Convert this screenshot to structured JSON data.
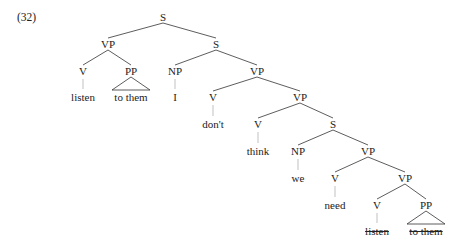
{
  "example_number": "(32)",
  "tree": {
    "nodes": [
      {
        "id": "s0",
        "label": "S",
        "x": 163,
        "y": 17
      },
      {
        "id": "vp1",
        "label": "VP",
        "x": 108,
        "y": 44
      },
      {
        "id": "s1",
        "label": "S",
        "x": 216,
        "y": 44
      },
      {
        "id": "v1",
        "label": "V",
        "x": 83,
        "y": 71
      },
      {
        "id": "pp1",
        "label": "PP",
        "x": 131,
        "y": 71
      },
      {
        "id": "np1",
        "label": "NP",
        "x": 175,
        "y": 71
      },
      {
        "id": "vp2",
        "label": "VP",
        "x": 257,
        "y": 71
      },
      {
        "id": "w_listen1",
        "label": "listen",
        "x": 83,
        "y": 97,
        "leaf": true
      },
      {
        "id": "w_tothem1",
        "label": "to them",
        "x": 131,
        "y": 97,
        "leaf": true
      },
      {
        "id": "w_I",
        "label": "I",
        "x": 175,
        "y": 97,
        "leaf": true
      },
      {
        "id": "v2",
        "label": "V",
        "x": 213,
        "y": 97
      },
      {
        "id": "vp3",
        "label": "VP",
        "x": 300,
        "y": 97
      },
      {
        "id": "w_dont",
        "label": "don't",
        "x": 213,
        "y": 124,
        "leaf": true
      },
      {
        "id": "v3",
        "label": "V",
        "x": 258,
        "y": 124
      },
      {
        "id": "s2",
        "label": "S",
        "x": 333,
        "y": 124
      },
      {
        "id": "w_think",
        "label": "think",
        "x": 258,
        "y": 151,
        "leaf": true
      },
      {
        "id": "np2",
        "label": "NP",
        "x": 298,
        "y": 151
      },
      {
        "id": "vp4",
        "label": "VP",
        "x": 368,
        "y": 151
      },
      {
        "id": "w_we",
        "label": "we",
        "x": 298,
        "y": 178,
        "leaf": true
      },
      {
        "id": "v4",
        "label": "V",
        "x": 335,
        "y": 178
      },
      {
        "id": "vp5",
        "label": "VP",
        "x": 405,
        "y": 178
      },
      {
        "id": "w_need",
        "label": "need",
        "x": 335,
        "y": 205,
        "leaf": true
      },
      {
        "id": "v5",
        "label": "V",
        "x": 377,
        "y": 205
      },
      {
        "id": "pp2",
        "label": "PP",
        "x": 426,
        "y": 205
      },
      {
        "id": "w_listen2",
        "label": "listen",
        "x": 377,
        "y": 231,
        "leaf": true,
        "deleted": true
      },
      {
        "id": "w_tothem2",
        "label": "to them",
        "x": 426,
        "y": 231,
        "leaf": true,
        "deleted": true
      }
    ],
    "branches": [
      [
        "s0",
        "vp1"
      ],
      [
        "s0",
        "s1"
      ],
      [
        "vp1",
        "v1"
      ],
      [
        "vp1",
        "pp1"
      ],
      [
        "s1",
        "np1"
      ],
      [
        "s1",
        "vp2"
      ],
      [
        "vp2",
        "v2"
      ],
      [
        "vp2",
        "vp3"
      ],
      [
        "vp3",
        "v3"
      ],
      [
        "vp3",
        "s2"
      ],
      [
        "s2",
        "np2"
      ],
      [
        "s2",
        "vp4"
      ],
      [
        "vp4",
        "v4"
      ],
      [
        "vp4",
        "vp5"
      ],
      [
        "vp5",
        "v5"
      ],
      [
        "vp5",
        "pp2"
      ]
    ],
    "unary_ticks": [
      [
        "v1",
        "w_listen1"
      ],
      [
        "np1",
        "w_I"
      ],
      [
        "v2",
        "w_dont"
      ],
      [
        "v3",
        "w_think"
      ],
      [
        "np2",
        "w_we"
      ],
      [
        "v4",
        "w_need"
      ],
      [
        "v5",
        "w_listen2"
      ]
    ],
    "triangles": [
      [
        "pp1",
        "w_tothem1"
      ],
      [
        "pp2",
        "w_tothem2"
      ]
    ]
  }
}
